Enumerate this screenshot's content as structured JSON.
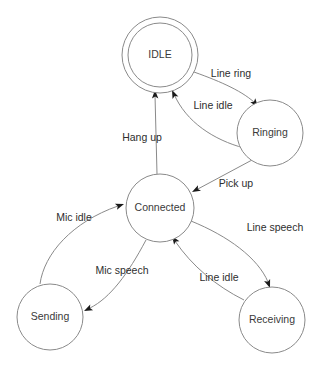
{
  "diagram": {
    "type": "state-diagram",
    "width": 322,
    "height": 379,
    "background_color": "#ffffff",
    "node_stroke_color": "#8a8a8a",
    "node_fill_color": "#ffffff",
    "edge_stroke_color": "#8a8a8a",
    "arrowhead_color": "#1a1a1a",
    "text_color": "#2e2e2e",
    "states": [
      {
        "id": "idle",
        "label": "IDLE",
        "cx": 160,
        "cy": 55,
        "r": 38,
        "double": true,
        "inner_r": 32
      },
      {
        "id": "ringing",
        "label": "Ringing",
        "cx": 270,
        "cy": 133,
        "r": 33,
        "double": false,
        "inner_r": 0
      },
      {
        "id": "connected",
        "label": "Connected",
        "cx": 160,
        "cy": 208,
        "r": 34,
        "double": false,
        "inner_r": 0
      },
      {
        "id": "sending",
        "label": "Sending",
        "cx": 50,
        "cy": 317,
        "r": 33,
        "double": false,
        "inner_r": 0
      },
      {
        "id": "receiving",
        "label": "Receiving",
        "cx": 272,
        "cy": 320,
        "r": 33,
        "double": false,
        "inner_r": 0
      }
    ],
    "transitions": [
      {
        "id": "idle-to-ringing",
        "label": "Line ring",
        "from": "idle",
        "to": "ringing",
        "label_x": 231,
        "label_y": 74,
        "path": "M 194,72 C 222,82 244,92 256,104",
        "head_x": 258,
        "head_y": 107,
        "head_angle": 52
      },
      {
        "id": "ringing-to-idle",
        "label": "Line idle",
        "from": "ringing",
        "to": "idle",
        "label_x": 213,
        "label_y": 106,
        "path": "M 244,148 C 214,140 186,122 174,94",
        "head_x": 172,
        "head_y": 90,
        "head_angle": -114
      },
      {
        "id": "ringing-to-connected",
        "label": "Pick up",
        "from": "ringing",
        "to": "connected",
        "label_x": 236,
        "label_y": 184,
        "path": "M 252,160 L 196,190",
        "head_x": 192,
        "head_y": 192,
        "head_angle": 152
      },
      {
        "id": "connected-to-idle",
        "label": "Hang up",
        "from": "connected",
        "to": "idle",
        "label_x": 142,
        "label_y": 138,
        "path": "M 157,174 L 155,95",
        "head_x": 155,
        "head_y": 90,
        "head_angle": -91
      },
      {
        "id": "sending-to-connected",
        "label": "Mic idle",
        "from": "sending",
        "to": "connected",
        "label_x": 74,
        "label_y": 218,
        "path": "M 40,284 C 44,254 72,222 118,206",
        "head_x": 124,
        "head_y": 204,
        "head_angle": -19
      },
      {
        "id": "connected-to-sending",
        "label": "Mic speech",
        "from": "connected",
        "to": "sending",
        "label_x": 122,
        "label_y": 271,
        "path": "M 146,240 C 128,274 110,298 90,308",
        "head_x": 84,
        "head_y": 311,
        "head_angle": 154
      },
      {
        "id": "connected-to-receiving",
        "label": "Line speech",
        "from": "connected",
        "to": "receiving",
        "label_x": 275,
        "label_y": 228,
        "path": "M 191,221 C 228,236 258,258 268,282",
        "head_x": 270,
        "head_y": 288,
        "head_angle": 70
      },
      {
        "id": "receiving-to-connected",
        "label": "Line idle",
        "from": "receiving",
        "to": "connected",
        "label_x": 219,
        "label_y": 278,
        "path": "M 244,300 C 216,286 192,266 175,241",
        "head_x": 172,
        "head_y": 236,
        "head_angle": -124
      }
    ]
  }
}
